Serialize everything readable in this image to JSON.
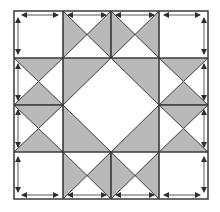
{
  "diagram": {
    "grid": {
      "rows": 4,
      "cols": 4
    },
    "colors": {
      "background": "#ffffff",
      "fill_dark": "#b9b9b9",
      "line": "#3a3a3a",
      "arrow": "#2f2f2f"
    },
    "units": [
      {
        "name": "corner-square-top-left",
        "type": "plain-square"
      },
      {
        "name": "hourglass-top-1",
        "type": "hourglass-horizontal-dark"
      },
      {
        "name": "hourglass-top-2",
        "type": "hourglass-horizontal-dark"
      },
      {
        "name": "corner-square-top-right",
        "type": "plain-square"
      },
      {
        "name": "hourglass-left-1",
        "type": "hourglass-vertical-dark"
      },
      {
        "name": "center-square-in-square",
        "type": "square-in-square"
      },
      {
        "name": "hourglass-right-1",
        "type": "hourglass-vertical-dark"
      },
      {
        "name": "hourglass-left-2",
        "type": "hourglass-vertical-dark"
      },
      {
        "name": "hourglass-right-2",
        "type": "hourglass-vertical-dark"
      },
      {
        "name": "corner-square-bottom-left",
        "type": "plain-square"
      },
      {
        "name": "hourglass-bottom-1",
        "type": "hourglass-horizontal-dark"
      },
      {
        "name": "hourglass-bottom-2",
        "type": "hourglass-horizontal-dark"
      },
      {
        "name": "corner-square-bottom-right",
        "type": "plain-square"
      }
    ],
    "arrows_meaning": "straight-grain direction along outer edges"
  }
}
